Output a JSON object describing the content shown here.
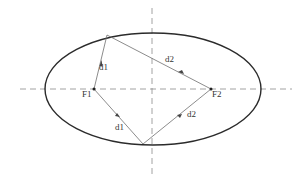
{
  "diagram": {
    "colors": {
      "ellipse": "#2b2b2b",
      "axes": "#8a8a8a",
      "lines": "#6e6e6e",
      "text": "#333333"
    },
    "ellipse": {
      "cx": 153,
      "cy": 89,
      "rx": 108,
      "ry": 56
    },
    "axes": {
      "horizontal": {
        "x1": 20,
        "x2": 292,
        "y": 89
      },
      "vertical": {
        "x": 152,
        "y1": 8,
        "y2": 176
      }
    },
    "foci": [
      {
        "id": "F1",
        "label": "F1",
        "x": 94,
        "y": 89,
        "label_x": 82,
        "label_y": 97
      },
      {
        "id": "F2",
        "label": "F2",
        "x": 211,
        "y": 89,
        "label_x": 212,
        "label_y": 97
      }
    ],
    "points": {
      "top": {
        "x": 107,
        "y": 35
      },
      "bottom": {
        "x": 143,
        "y": 144
      }
    },
    "segments": [
      {
        "label": "d1",
        "from": "F1",
        "to": "top",
        "label_x": 99,
        "label_y": 70
      },
      {
        "label": "d2",
        "from": "F2",
        "to": "top",
        "label_x": 165,
        "label_y": 62
      },
      {
        "label": "d1",
        "from": "F1",
        "to": "bottom",
        "label_x": 115,
        "label_y": 130
      },
      {
        "label": "d2",
        "from": "F2",
        "to": "bottom",
        "label_x": 187,
        "label_y": 117
      }
    ]
  }
}
